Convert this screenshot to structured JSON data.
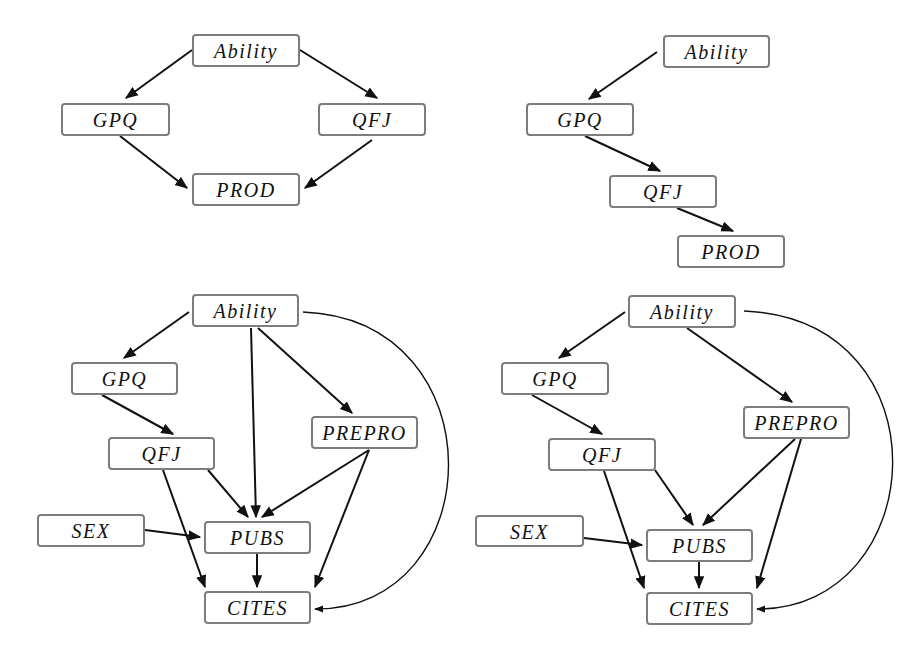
{
  "colors": {
    "edge": "#111111",
    "node_border": "#7d7d7d",
    "node_fill": "#ffffff",
    "text": "#111111",
    "background": "#ffffff"
  },
  "diagrams": [
    {
      "id": "top-left",
      "nodes": [
        {
          "id": "ability",
          "label": "Ability",
          "x": 192,
          "y": 34,
          "w": 108,
          "h": 33
        },
        {
          "id": "gpq",
          "label": "GPQ",
          "x": 61,
          "y": 103,
          "w": 109,
          "h": 33
        },
        {
          "id": "qfj",
          "label": "QFJ",
          "x": 318,
          "y": 103,
          "w": 108,
          "h": 33
        },
        {
          "id": "prod",
          "label": "PROD",
          "x": 192,
          "y": 173,
          "w": 108,
          "h": 33
        }
      ],
      "edges": [
        {
          "from": "ability",
          "to": "gpq",
          "path": "M192 50 L126 98"
        },
        {
          "from": "ability",
          "to": "qfj",
          "path": "M300 50 L377 98"
        },
        {
          "from": "gpq",
          "to": "prod",
          "path": "M120 136 L187 188"
        },
        {
          "from": "qfj",
          "to": "prod",
          "path": "M372 140 L305 188"
        }
      ]
    },
    {
      "id": "top-right",
      "nodes": [
        {
          "id": "ability",
          "label": "Ability",
          "x": 663,
          "y": 35,
          "w": 107,
          "h": 33
        },
        {
          "id": "gpq",
          "label": "GPQ",
          "x": 526,
          "y": 103,
          "w": 108,
          "h": 33
        },
        {
          "id": "qfj",
          "label": "QFJ",
          "x": 609,
          "y": 175,
          "w": 108,
          "h": 33
        },
        {
          "id": "prod",
          "label": "PROD",
          "x": 677,
          "y": 235,
          "w": 108,
          "h": 33
        }
      ],
      "edges": [
        {
          "from": "ability",
          "to": "gpq",
          "path": "M657 52 L589 99"
        },
        {
          "from": "gpq",
          "to": "qfj",
          "path": "M585 136 L660 171"
        },
        {
          "from": "qfj",
          "to": "prod",
          "path": "M677 208 L733 231"
        }
      ]
    },
    {
      "id": "bottom-left",
      "nodes": [
        {
          "id": "ability",
          "label": "Ability",
          "x": 192,
          "y": 294,
          "w": 107,
          "h": 33
        },
        {
          "id": "gpq",
          "label": "GPQ",
          "x": 71,
          "y": 362,
          "w": 107,
          "h": 33
        },
        {
          "id": "prepro",
          "label": "PREPRO",
          "x": 311,
          "y": 416,
          "w": 107,
          "h": 33
        },
        {
          "id": "qfj",
          "label": "QFJ",
          "x": 108,
          "y": 437,
          "w": 107,
          "h": 33
        },
        {
          "id": "sex",
          "label": "SEX",
          "x": 37,
          "y": 514,
          "w": 108,
          "h": 33
        },
        {
          "id": "pubs",
          "label": "PUBS",
          "x": 204,
          "y": 521,
          "w": 107,
          "h": 33
        },
        {
          "id": "cites",
          "label": "CITES",
          "x": 204,
          "y": 591,
          "w": 107,
          "h": 33
        }
      ],
      "edges": [
        {
          "from": "ability",
          "to": "gpq",
          "path": "M189 312 L124 358"
        },
        {
          "from": "ability",
          "to": "prepro",
          "path": "M258 328 L352 413"
        },
        {
          "from": "ability",
          "to": "pubs",
          "path": "M251 328 L256 517"
        },
        {
          "from": "gpq",
          "to": "qfj",
          "path": "M102 395 L173 434"
        },
        {
          "from": "qfj",
          "to": "pubs",
          "path": "M208 470 L248 517"
        },
        {
          "from": "qfj",
          "to": "cites",
          "path": "M163 470 L205 587"
        },
        {
          "from": "prepro",
          "to": "pubs",
          "path": "M369 450 L262 517"
        },
        {
          "from": "prepro",
          "to": "cites",
          "path": "M369 450 L315 587"
        },
        {
          "from": "sex",
          "to": "pubs",
          "path": "M145 530 L200 537"
        },
        {
          "from": "pubs",
          "to": "cites",
          "path": "M257 554 L257 587"
        },
        {
          "from": "ability",
          "to": "cites",
          "path": "M303 312 C 500 320, 490 610, 315 609"
        }
      ]
    },
    {
      "id": "bottom-right",
      "nodes": [
        {
          "id": "ability",
          "label": "Ability",
          "x": 628,
          "y": 295,
          "w": 108,
          "h": 33
        },
        {
          "id": "gpq",
          "label": "GPQ",
          "x": 501,
          "y": 362,
          "w": 108,
          "h": 33
        },
        {
          "id": "prepro",
          "label": "PREPRO",
          "x": 743,
          "y": 406,
          "w": 107,
          "h": 33
        },
        {
          "id": "qfj",
          "label": "QFJ",
          "x": 548,
          "y": 438,
          "w": 108,
          "h": 33
        },
        {
          "id": "sex",
          "label": "SEX",
          "x": 475,
          "y": 515,
          "w": 109,
          "h": 32
        },
        {
          "id": "pubs",
          "label": "PUBS",
          "x": 646,
          "y": 529,
          "w": 107,
          "h": 33
        },
        {
          "id": "cites",
          "label": "CITES",
          "x": 646,
          "y": 592,
          "w": 107,
          "h": 33
        }
      ],
      "edges": [
        {
          "from": "ability",
          "to": "gpq",
          "path": "M625 312 L559 358"
        },
        {
          "from": "ability",
          "to": "prepro",
          "path": "M687 328 L792 402"
        },
        {
          "from": "gpq",
          "to": "qfj",
          "path": "M532 395 L602 434"
        },
        {
          "from": "qfj",
          "to": "pubs",
          "path": "M655 470 L693 525"
        },
        {
          "from": "qfj",
          "to": "cites",
          "path": "M604 471 L644 588"
        },
        {
          "from": "prepro",
          "to": "pubs",
          "path": "M795 439 L703 525"
        },
        {
          "from": "prepro",
          "to": "cites",
          "path": "M801 439 L757 588"
        },
        {
          "from": "sex",
          "to": "pubs",
          "path": "M584 538 L642 545"
        },
        {
          "from": "pubs",
          "to": "cites",
          "path": "M699 562 L699 588"
        },
        {
          "from": "ability",
          "to": "cites",
          "path": "M744 311 C 950 320, 930 610, 757 609"
        }
      ]
    }
  ]
}
